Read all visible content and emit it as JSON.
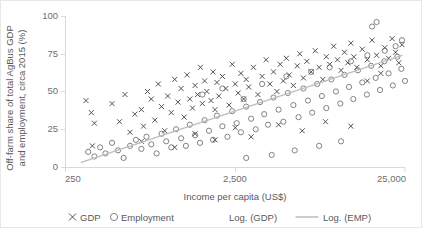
{
  "chart_data": {
    "type": "scatter",
    "title": "",
    "xlabel": "Income per capita (US$)",
    "ylabel": "Off-farm share of total AgBus GDP and employment, circa 2015 (%)",
    "ylabel_line1": "Off-farm share of total AgBus GDP",
    "ylabel_line2": "and employment, circa 2015 (%)",
    "x_scale": "log",
    "xlim": [
      250,
      25000
    ],
    "ylim": [
      0,
      100
    ],
    "xticks": [
      250,
      2500,
      25000
    ],
    "xticklabels": [
      "250",
      "2,500",
      "25,000"
    ],
    "yticks": [
      0,
      25,
      50,
      75,
      100
    ],
    "yticklabels": [
      "0",
      "25",
      "50",
      "75",
      "100"
    ],
    "grid": false,
    "legend_position": "below-axis",
    "colors": {
      "gdp_marker": "#414042",
      "emp_marker": "#6d6e71",
      "trendline": "#bcbdc0",
      "axis": "#d9d9d9",
      "text": "#58595b"
    },
    "legend": [
      {
        "label": "GDP",
        "marker": "x-marker"
      },
      {
        "label": "Employment",
        "marker": "o-marker"
      },
      {
        "label": "Log. (GDP)",
        "marker": "trendline-swatch"
      },
      {
        "label": "Log. (EMP)",
        "marker": "trendline-line"
      }
    ],
    "series": [
      {
        "name": "GDP",
        "marker": "x",
        "points": [
          [
            330,
            44
          ],
          [
            355,
            36
          ],
          [
            370,
            29
          ],
          [
            360,
            14
          ],
          [
            470,
            42
          ],
          [
            520,
            30
          ],
          [
            560,
            48
          ],
          [
            600,
            23
          ],
          [
            640,
            35
          ],
          [
            700,
            38
          ],
          [
            720,
            27
          ],
          [
            760,
            50
          ],
          [
            800,
            45
          ],
          [
            840,
            31
          ],
          [
            880,
            55
          ],
          [
            920,
            40
          ],
          [
            960,
            24
          ],
          [
            1000,
            47
          ],
          [
            1050,
            36
          ],
          [
            1100,
            58
          ],
          [
            1150,
            43
          ],
          [
            1200,
            52
          ],
          [
            1250,
            33
          ],
          [
            1300,
            61
          ],
          [
            1350,
            45
          ],
          [
            1400,
            39
          ],
          [
            1450,
            54
          ],
          [
            1500,
            48
          ],
          [
            1560,
            66
          ],
          [
            1600,
            42
          ],
          [
            1650,
            57
          ],
          [
            1700,
            50
          ],
          [
            1800,
            44
          ],
          [
            1850,
            63
          ],
          [
            1900,
            38
          ],
          [
            1950,
            56
          ],
          [
            2000,
            47
          ],
          [
            2100,
            60
          ],
          [
            2200,
            52
          ],
          [
            2300,
            41
          ],
          [
            2400,
            68
          ],
          [
            2500,
            55
          ],
          [
            2600,
            49
          ],
          [
            2700,
            62
          ],
          [
            2800,
            45
          ],
          [
            2900,
            58
          ],
          [
            3000,
            53
          ],
          [
            3200,
            66
          ],
          [
            3400,
            48
          ],
          [
            3600,
            60
          ],
          [
            3800,
            71
          ],
          [
            4000,
            55
          ],
          [
            4200,
            63
          ],
          [
            4400,
            50
          ],
          [
            4600,
            68
          ],
          [
            4800,
            57
          ],
          [
            5000,
            72
          ],
          [
            5200,
            61
          ],
          [
            5500,
            54
          ],
          [
            5800,
            67
          ],
          [
            6000,
            75
          ],
          [
            6300,
            59
          ],
          [
            6600,
            70
          ],
          [
            7000,
            63
          ],
          [
            7400,
            77
          ],
          [
            7800,
            66
          ],
          [
            8200,
            58
          ],
          [
            8600,
            73
          ],
          [
            9000,
            68
          ],
          [
            9500,
            80
          ],
          [
            10000,
            71
          ],
          [
            10500,
            64
          ],
          [
            11000,
            76
          ],
          [
            11500,
            69
          ],
          [
            12000,
            82
          ],
          [
            12500,
            73
          ],
          [
            13000,
            66
          ],
          [
            14000,
            78
          ],
          [
            15000,
            71
          ],
          [
            16000,
            84
          ],
          [
            17000,
            74
          ],
          [
            18000,
            67
          ],
          [
            19000,
            79
          ],
          [
            20000,
            72
          ],
          [
            21000,
            85
          ],
          [
            22000,
            76
          ],
          [
            23000,
            69
          ],
          [
            24000,
            81
          ],
          [
            1450,
            22
          ],
          [
            1900,
            18
          ],
          [
            2500,
            26
          ],
          [
            3100,
            20
          ],
          [
            4500,
            28
          ],
          [
            6200,
            24
          ],
          [
            8500,
            30
          ],
          [
            12000,
            27
          ],
          [
            700,
            17
          ],
          [
            1100,
            13
          ],
          [
            15000,
            57
          ],
          [
            18000,
            62
          ]
        ]
      },
      {
        "name": "Employment",
        "marker": "o",
        "points": [
          [
            340,
            10
          ],
          [
            370,
            7
          ],
          [
            400,
            13
          ],
          [
            430,
            9
          ],
          [
            470,
            16
          ],
          [
            510,
            11
          ],
          [
            550,
            6
          ],
          [
            600,
            14
          ],
          [
            650,
            18
          ],
          [
            700,
            12
          ],
          [
            750,
            20
          ],
          [
            800,
            15
          ],
          [
            860,
            9
          ],
          [
            920,
            22
          ],
          [
            980,
            17
          ],
          [
            1050,
            13
          ],
          [
            1120,
            25
          ],
          [
            1200,
            19
          ],
          [
            1280,
            14
          ],
          [
            1350,
            28
          ],
          [
            1450,
            21
          ],
          [
            1550,
            16
          ],
          [
            1650,
            31
          ],
          [
            1750,
            24
          ],
          [
            1850,
            18
          ],
          [
            1950,
            34
          ],
          [
            2100,
            27
          ],
          [
            2250,
            20
          ],
          [
            2400,
            37
          ],
          [
            2550,
            29
          ],
          [
            2700,
            23
          ],
          [
            2900,
            40
          ],
          [
            3100,
            32
          ],
          [
            3300,
            25
          ],
          [
            3500,
            43
          ],
          [
            3700,
            35
          ],
          [
            3900,
            28
          ],
          [
            4200,
            46
          ],
          [
            4500,
            38
          ],
          [
            4800,
            30
          ],
          [
            5100,
            49
          ],
          [
            5500,
            41
          ],
          [
            5900,
            33
          ],
          [
            6300,
            52
          ],
          [
            6700,
            44
          ],
          [
            7100,
            36
          ],
          [
            7600,
            55
          ],
          [
            8100,
            47
          ],
          [
            8600,
            39
          ],
          [
            9200,
            58
          ],
          [
            9800,
            50
          ],
          [
            10400,
            42
          ],
          [
            11000,
            61
          ],
          [
            11700,
            53
          ],
          [
            12400,
            45
          ],
          [
            13200,
            64
          ],
          [
            14000,
            56
          ],
          [
            14900,
            48
          ],
          [
            15800,
            67
          ],
          [
            16800,
            59
          ],
          [
            17800,
            51
          ],
          [
            18900,
            70
          ],
          [
            20000,
            62
          ],
          [
            21200,
            54
          ],
          [
            22500,
            73
          ],
          [
            23800,
            65
          ],
          [
            25000,
            57
          ],
          [
            1600,
            48
          ],
          [
            2100,
            52
          ],
          [
            2800,
            45
          ],
          [
            3600,
            55
          ],
          [
            5000,
            60
          ],
          [
            7000,
            63
          ],
          [
            9000,
            66
          ],
          [
            12000,
            70
          ],
          [
            15000,
            74
          ],
          [
            19000,
            77
          ],
          [
            22000,
            80
          ],
          [
            24000,
            84
          ],
          [
            16000,
            93
          ],
          [
            17000,
            96
          ],
          [
            4100,
            8
          ],
          [
            5600,
            11
          ],
          [
            7800,
            14
          ],
          [
            10500,
            17
          ],
          [
            2900,
            6
          ]
        ]
      }
    ],
    "trendlines": [
      {
        "name": "Log. (GDP)",
        "x_start": 310,
        "y_start": 3,
        "x_end": 24000,
        "y_end": 74
      },
      {
        "name": "Log. (EMP)",
        "x_start": 310,
        "y_start": 3,
        "x_end": 24000,
        "y_end": 74
      }
    ]
  }
}
